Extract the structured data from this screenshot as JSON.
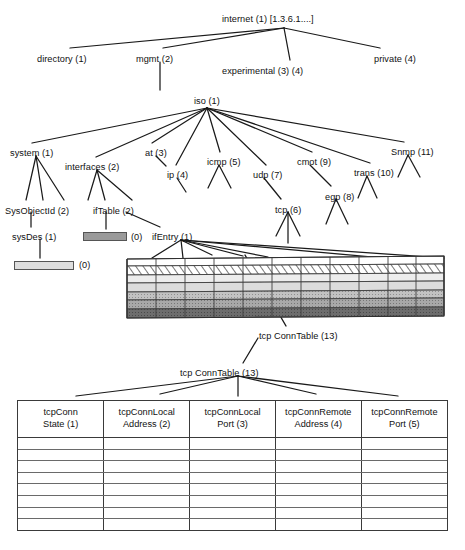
{
  "figure": {
    "caption": ""
  },
  "colors": {
    "line": "#1a1a1a",
    "text": "#111111",
    "box_dark": "#9a9a9a",
    "box_light": "#dedede",
    "table_border": "#3a3a3a",
    "row_rule": "#6a6a6a",
    "background": "#ffffff"
  },
  "tree": {
    "root": {
      "label": "internet (1) [1.3.6.1....]",
      "x": 222,
      "y": 14
    },
    "nodes": [
      {
        "id": "directory",
        "label": "directory (1)",
        "x": 37,
        "y": 54
      },
      {
        "id": "mgmt",
        "label": "mgmt (2)",
        "x": 136,
        "y": 54
      },
      {
        "id": "experimental",
        "label": "experimental (3) (4)",
        "x": 222,
        "y": 66
      },
      {
        "id": "private",
        "label": "private (4)",
        "x": 374,
        "y": 54
      },
      {
        "id": "iso",
        "label": "iso (1)",
        "x": 194,
        "y": 96
      },
      {
        "id": "system",
        "label": "system (1)",
        "x": 10,
        "y": 148
      },
      {
        "id": "interfaces",
        "label": "interfaces (2)",
        "x": 65,
        "y": 162
      },
      {
        "id": "at",
        "label": "at (3)",
        "x": 145,
        "y": 148
      },
      {
        "id": "ip",
        "label": "ip (4)",
        "x": 167,
        "y": 170
      },
      {
        "id": "icmp",
        "label": "icmp (5)",
        "x": 207,
        "y": 157
      },
      {
        "id": "udp",
        "label": "udp (7)",
        "x": 253,
        "y": 170
      },
      {
        "id": "cmot",
        "label": "cmot (9)",
        "x": 297,
        "y": 157
      },
      {
        "id": "trans",
        "label": "trans (10)",
        "x": 354,
        "y": 168
      },
      {
        "id": "snmp",
        "label": "Snmp (11)",
        "x": 391,
        "y": 147
      },
      {
        "id": "sysobjectid",
        "label": "SysObjectId (2)",
        "x": 5,
        "y": 206
      },
      {
        "id": "iftable",
        "label": "ifTable (2)",
        "x": 93,
        "y": 206
      },
      {
        "id": "sysdes",
        "label": "sysDes (1)",
        "x": 12,
        "y": 232
      },
      {
        "id": "ifentry",
        "label": "ifEntry (1)",
        "x": 152,
        "y": 232
      },
      {
        "id": "tcp",
        "label": "tcp (6)",
        "x": 275,
        "y": 205
      },
      {
        "id": "egp",
        "label": "egp (8)",
        "x": 325,
        "y": 192
      },
      {
        "id": "tcpconntable_upper",
        "label": "tcp ConnTable (13)",
        "x": 259,
        "y": 331
      },
      {
        "id": "tcpconntable_lower",
        "label": "tcp ConnTable (13)",
        "x": 180,
        "y": 368
      }
    ],
    "leaf_boxes": [
      {
        "id": "iftable-box",
        "shade": "dark",
        "x": 83,
        "y": 232,
        "w": 44,
        "h": 9
      },
      {
        "id": "sysdes-box",
        "shade": "light",
        "x": 14,
        "y": 261,
        "w": 60,
        "h": 9
      }
    ],
    "zero_marks": [
      {
        "id": "iftable-zero",
        "label": "(0)",
        "x": 131,
        "y": 232
      },
      {
        "id": "sysdes-zero",
        "label": "(0)",
        "x": 79,
        "y": 260
      }
    ]
  },
  "slab": {
    "name": "ifEntry instance grid",
    "columns": 11,
    "rows": [
      {
        "name": "row-white",
        "fill": "#ffffff",
        "pattern": "none"
      },
      {
        "name": "row-hatched",
        "fill": "#ffffff",
        "pattern": "diagonal-hatch"
      },
      {
        "name": "row-light",
        "fill": "#ededed",
        "pattern": "none"
      },
      {
        "name": "row-light-mid",
        "fill": "#dcdcdc",
        "pattern": "none"
      },
      {
        "name": "row-mid",
        "fill": "#c2c2c2",
        "pattern": "stipple"
      },
      {
        "name": "row-mid-dark",
        "fill": "#a8a8a8",
        "pattern": "stipple"
      },
      {
        "name": "row-dark",
        "fill": "#6d6d6d",
        "pattern": "stipple"
      }
    ]
  },
  "conn_table": {
    "name": "tcpConnTable",
    "headers": [
      {
        "line1": "tcpConn",
        "line2": "State (1)"
      },
      {
        "line1": "tcpConnLocal",
        "line2": "Address (2)"
      },
      {
        "line1": "tcpConnLocal",
        "line2": "Port (3)"
      },
      {
        "line1": "tcpConnRemote",
        "line2": "Address (4)"
      },
      {
        "line1": "tcpConnRemote",
        "line2": "Port (5)"
      }
    ],
    "body_row_count": 8,
    "body_rows": [
      [
        "",
        "",
        "",
        "",
        ""
      ],
      [
        "",
        "",
        "",
        "",
        ""
      ],
      [
        "",
        "",
        "",
        "",
        ""
      ],
      [
        "",
        "",
        "",
        "",
        ""
      ],
      [
        "",
        "",
        "",
        "",
        ""
      ],
      [
        "",
        "",
        "",
        "",
        ""
      ],
      [
        "",
        "",
        "",
        "",
        ""
      ],
      [
        "",
        "",
        "",
        "",
        ""
      ]
    ]
  }
}
